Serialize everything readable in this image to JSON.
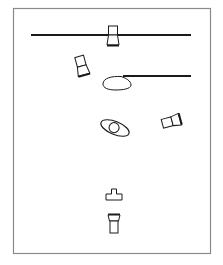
{
  "diagram": {
    "type": "lighting-plot",
    "colors": {
      "background": "#ffffff",
      "frame": "#8a8a8a",
      "stroke": "#1a1a1a"
    },
    "frame": {
      "x": 13,
      "y": 8,
      "width": 198,
      "height": 246
    },
    "elements": [
      {
        "id": "batten-top",
        "kind": "pipe",
        "x1": 31,
        "y1": 35,
        "x2": 191,
        "y2": 35
      },
      {
        "id": "fixture-top",
        "kind": "light-fixture",
        "cx": 113,
        "cy": 36,
        "rotation": 0
      },
      {
        "id": "fixture-left",
        "kind": "light-fixture",
        "cx": 82,
        "cy": 67,
        "rotation": -15
      },
      {
        "id": "boom-line",
        "kind": "pipe",
        "x1": 123,
        "y1": 76,
        "x2": 191,
        "y2": 76
      },
      {
        "id": "table-ellipse",
        "kind": "ellipse",
        "cx": 117,
        "cy": 83,
        "rx": 14,
        "ry": 7
      },
      {
        "id": "lens-subject",
        "kind": "ellipse-with-circle",
        "cx": 115,
        "cy": 128,
        "rx": 15,
        "ry": 7,
        "rotation": 20
      },
      {
        "id": "fixture-right",
        "kind": "light-fixture",
        "cx": 166,
        "cy": 121,
        "rotation": -105
      },
      {
        "id": "stand-base",
        "kind": "stand",
        "cx": 114,
        "cy": 195
      },
      {
        "id": "fixture-bottom",
        "kind": "light-fixture",
        "cx": 114,
        "cy": 223,
        "rotation": 180
      }
    ]
  }
}
